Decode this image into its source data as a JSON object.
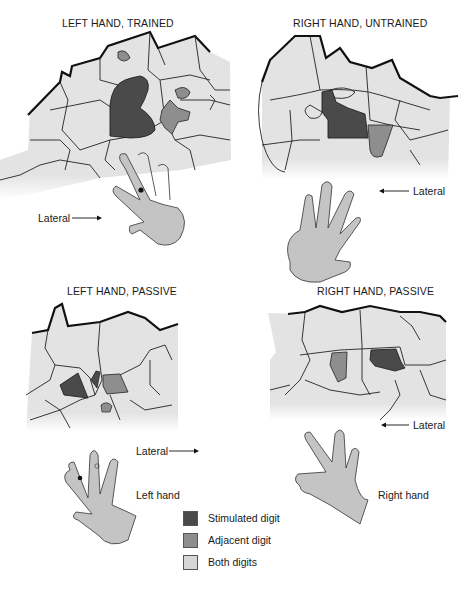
{
  "panels": [
    {
      "id": "left-trained",
      "title": "LEFT HAND, TRAINED"
    },
    {
      "id": "right-untrained",
      "title": "RIGHT HAND, UNTRAINED"
    },
    {
      "id": "left-passive",
      "title": "LEFT HAND, PASSIVE"
    },
    {
      "id": "right-passive",
      "title": "RIGHT HAND, PASSIVE"
    }
  ],
  "direction_labels": {
    "left_trained": "Lateral",
    "right_untrained": "Lateral",
    "left_passive": "Lateral",
    "right_passive": "Lateral"
  },
  "hand_labels": {
    "left": "Left hand",
    "right": "Right hand"
  },
  "legend": {
    "items": [
      {
        "label": "Stimulated digit",
        "color": "#4a4a4a"
      },
      {
        "label": "Adjacent digit",
        "color": "#8e8e8e"
      },
      {
        "label": "Both digits",
        "color": "#d6d6d6"
      }
    ]
  },
  "colors": {
    "cortex_fill": "#e3e3e3",
    "stimulated": "#4a4a4a",
    "adjacent": "#8e8e8e",
    "hand_fill": "#c4c4c4",
    "outline": "#222222"
  }
}
